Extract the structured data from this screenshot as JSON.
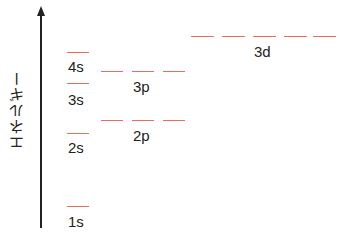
{
  "diagram": {
    "axis_label": "エネルギー",
    "line_color": "#e8705a",
    "levels": [
      {
        "name": "1s",
        "orbitals": 1,
        "y": 206
      },
      {
        "name": "2s",
        "orbitals": 1,
        "y": 133
      },
      {
        "name": "2p",
        "orbitals": 3,
        "y": 120
      },
      {
        "name": "3s",
        "orbitals": 1,
        "y": 83
      },
      {
        "name": "3p",
        "orbitals": 3,
        "y": 71
      },
      {
        "name": "4s",
        "orbitals": 1,
        "y": 52
      },
      {
        "name": "3d",
        "orbitals": 5,
        "y": 36
      }
    ]
  }
}
